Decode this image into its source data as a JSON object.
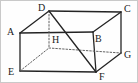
{
  "figure": {
    "type": "geometry-diagram",
    "shape_name": "rectangular-prism",
    "canvas": {
      "width": 138,
      "height": 83
    },
    "style": {
      "background": "#fefefe",
      "border_color": "#c9c9c9",
      "stroke_color": "#242424",
      "hidden_stroke_color": "#5a5a5a",
      "stroke_width": 1.3,
      "hidden_dash": "1.6 1.8",
      "label_color": "#1a1a1a",
      "label_font_size": 10
    },
    "vertices": [
      {
        "id": "A",
        "label": "A",
        "x": 19,
        "y": 32,
        "label_x": 6,
        "label_y": 26,
        "hidden": false
      },
      {
        "id": "B",
        "label": "B",
        "x": 92,
        "y": 31,
        "label_x": 94,
        "label_y": 33,
        "hidden": false
      },
      {
        "id": "C",
        "label": "C",
        "x": 120,
        "y": 11,
        "label_x": 123,
        "label_y": 3,
        "hidden": false
      },
      {
        "id": "D",
        "label": "D",
        "x": 48,
        "y": 10,
        "label_x": 37,
        "label_y": 2,
        "hidden": false
      },
      {
        "id": "E",
        "label": "E",
        "x": 19,
        "y": 70,
        "label_x": 7,
        "label_y": 66,
        "hidden": false
      },
      {
        "id": "F",
        "label": "F",
        "x": 95,
        "y": 71,
        "label_x": 98,
        "label_y": 71,
        "hidden": false
      },
      {
        "id": "G",
        "label": "G",
        "x": 120,
        "y": 52,
        "label_x": 123,
        "label_y": 49,
        "hidden": false
      },
      {
        "id": "H",
        "label": "H",
        "x": 48,
        "y": 47,
        "label_x": 51,
        "label_y": 34,
        "hidden": true
      }
    ],
    "edges": [
      {
        "from": "A",
        "to": "D",
        "hidden": false
      },
      {
        "from": "D",
        "to": "C",
        "hidden": false
      },
      {
        "from": "C",
        "to": "B",
        "hidden": false
      },
      {
        "from": "B",
        "to": "A",
        "hidden": false
      },
      {
        "from": "A",
        "to": "E",
        "hidden": false
      },
      {
        "from": "B",
        "to": "F",
        "hidden": false
      },
      {
        "from": "C",
        "to": "G",
        "hidden": false
      },
      {
        "from": "E",
        "to": "F",
        "hidden": false
      },
      {
        "from": "F",
        "to": "G",
        "hidden": false
      },
      {
        "from": "D",
        "to": "H",
        "hidden": true
      },
      {
        "from": "E",
        "to": "H",
        "hidden": true
      },
      {
        "from": "H",
        "to": "G",
        "hidden": true
      }
    ],
    "diagonals": [
      {
        "from": "D",
        "to": "F",
        "hidden": false
      }
    ]
  }
}
